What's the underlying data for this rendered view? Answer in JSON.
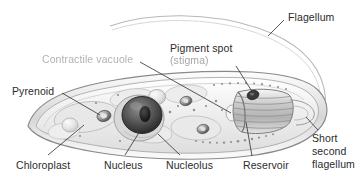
{
  "figure": {
    "organism": "Euglena",
    "style": "grayscale scientific line drawing",
    "width": 362,
    "height": 184,
    "background_color": "#ffffff",
    "ink_color": "#2b2b2b",
    "faded_ink_color": "#9c9c9c"
  },
  "labels": {
    "flagellum": "Flagellum",
    "pigment_spot_line1": "Pigment spot",
    "pigment_spot_line2": "(stigma)",
    "contractile_vacuole": "Contractile vacuole",
    "pyrenoid": "Pyrenoid",
    "chloroplast": "Chloroplast",
    "nucleus": "Nucleus",
    "nucleolus": "Nucleolus",
    "reservoir": "Reservoir",
    "short_second_flagellum_line1": "Short",
    "short_second_flagellum_line2": "second",
    "short_second_flagellum_line3": "flagellum"
  },
  "structures": [
    {
      "name": "flagellum",
      "description": "long anterior whip-like appendage curving up and to the left"
    },
    {
      "name": "pigment-spot-stigma",
      "description": "dark eyespot near anterior reservoir"
    },
    {
      "name": "contractile-vacuole",
      "description": "small pale oval vacuole beside the reservoir"
    },
    {
      "name": "pyrenoid",
      "description": "small granule within chloroplast"
    },
    {
      "name": "chloroplast",
      "description": "elongated plastid bodies through the cell"
    },
    {
      "name": "nucleus",
      "description": "large dark central sphere"
    },
    {
      "name": "nucleolus",
      "description": "dense body inside nucleus"
    },
    {
      "name": "reservoir",
      "description": "striated anterior flask-shaped chamber"
    },
    {
      "name": "short-second-flagellum",
      "description": "short flagellum stub at anterior opening"
    },
    {
      "name": "pellicle",
      "description": "outer cell membrane with fine granules"
    }
  ]
}
